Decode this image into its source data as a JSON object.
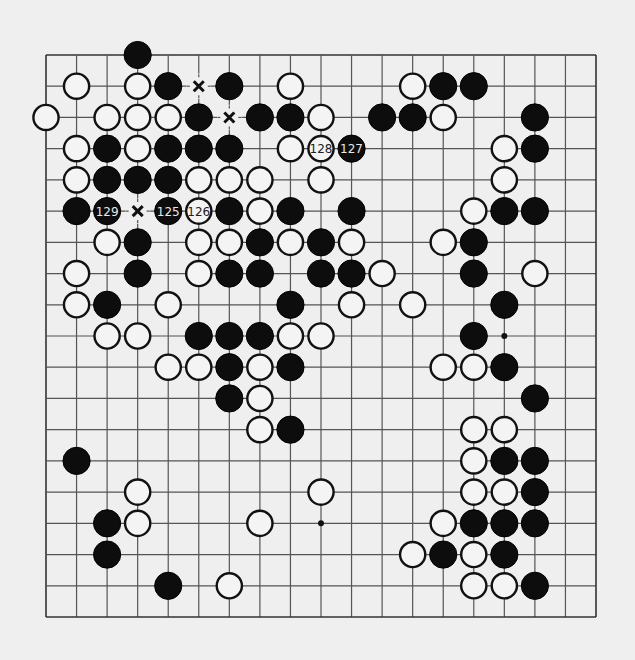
{
  "board": {
    "size": 19,
    "colors": {
      "background": "#efefef",
      "line": "#555555",
      "black_stone": "#0d0d0d",
      "white_stone": "#f4f4f4"
    },
    "stones": [
      {
        "row": 0,
        "col": 3,
        "color": "black"
      },
      {
        "row": 1,
        "col": 1,
        "color": "white"
      },
      {
        "row": 1,
        "col": 3,
        "color": "white"
      },
      {
        "row": 1,
        "col": 4,
        "color": "black"
      },
      {
        "row": 1,
        "col": 6,
        "color": "black"
      },
      {
        "row": 1,
        "col": 8,
        "color": "white"
      },
      {
        "row": 1,
        "col": 12,
        "color": "white"
      },
      {
        "row": 1,
        "col": 13,
        "color": "black"
      },
      {
        "row": 1,
        "col": 14,
        "color": "black"
      },
      {
        "row": 2,
        "col": 0,
        "color": "white"
      },
      {
        "row": 2,
        "col": 2,
        "color": "white"
      },
      {
        "row": 2,
        "col": 3,
        "color": "white"
      },
      {
        "row": 2,
        "col": 4,
        "color": "white"
      },
      {
        "row": 2,
        "col": 5,
        "color": "black"
      },
      {
        "row": 2,
        "col": 7,
        "color": "black"
      },
      {
        "row": 2,
        "col": 8,
        "color": "black"
      },
      {
        "row": 2,
        "col": 9,
        "color": "white"
      },
      {
        "row": 2,
        "col": 11,
        "color": "black"
      },
      {
        "row": 2,
        "col": 12,
        "color": "black"
      },
      {
        "row": 2,
        "col": 13,
        "color": "white"
      },
      {
        "row": 2,
        "col": 16,
        "color": "black"
      },
      {
        "row": 3,
        "col": 1,
        "color": "white"
      },
      {
        "row": 3,
        "col": 2,
        "color": "black"
      },
      {
        "row": 3,
        "col": 3,
        "color": "white"
      },
      {
        "row": 3,
        "col": 4,
        "color": "black"
      },
      {
        "row": 3,
        "col": 5,
        "color": "black"
      },
      {
        "row": 3,
        "col": 6,
        "color": "black"
      },
      {
        "row": 3,
        "col": 8,
        "color": "white"
      },
      {
        "row": 3,
        "col": 9,
        "color": "white",
        "label": "128"
      },
      {
        "row": 3,
        "col": 10,
        "color": "black",
        "label": "127"
      },
      {
        "row": 3,
        "col": 15,
        "color": "white"
      },
      {
        "row": 3,
        "col": 16,
        "color": "black"
      },
      {
        "row": 4,
        "col": 1,
        "color": "white"
      },
      {
        "row": 4,
        "col": 2,
        "color": "black"
      },
      {
        "row": 4,
        "col": 3,
        "color": "black"
      },
      {
        "row": 4,
        "col": 4,
        "color": "black"
      },
      {
        "row": 4,
        "col": 5,
        "color": "white"
      },
      {
        "row": 4,
        "col": 6,
        "color": "white"
      },
      {
        "row": 4,
        "col": 7,
        "color": "white"
      },
      {
        "row": 4,
        "col": 9,
        "color": "white"
      },
      {
        "row": 4,
        "col": 15,
        "color": "white"
      },
      {
        "row": 5,
        "col": 1,
        "color": "black"
      },
      {
        "row": 5,
        "col": 2,
        "color": "black",
        "label": "129"
      },
      {
        "row": 5,
        "col": 4,
        "color": "black",
        "label": "125"
      },
      {
        "row": 5,
        "col": 5,
        "color": "white",
        "label": "126"
      },
      {
        "row": 5,
        "col": 6,
        "color": "black"
      },
      {
        "row": 5,
        "col": 7,
        "color": "white"
      },
      {
        "row": 5,
        "col": 8,
        "color": "black"
      },
      {
        "row": 5,
        "col": 10,
        "color": "black"
      },
      {
        "row": 5,
        "col": 14,
        "color": "white"
      },
      {
        "row": 5,
        "col": 15,
        "color": "black"
      },
      {
        "row": 5,
        "col": 16,
        "color": "black"
      },
      {
        "row": 6,
        "col": 2,
        "color": "white"
      },
      {
        "row": 6,
        "col": 3,
        "color": "black"
      },
      {
        "row": 6,
        "col": 5,
        "color": "white"
      },
      {
        "row": 6,
        "col": 6,
        "color": "white"
      },
      {
        "row": 6,
        "col": 7,
        "color": "black"
      },
      {
        "row": 6,
        "col": 8,
        "color": "white"
      },
      {
        "row": 6,
        "col": 9,
        "color": "black"
      },
      {
        "row": 6,
        "col": 10,
        "color": "white"
      },
      {
        "row": 6,
        "col": 13,
        "color": "white"
      },
      {
        "row": 6,
        "col": 14,
        "color": "black"
      },
      {
        "row": 7,
        "col": 1,
        "color": "white"
      },
      {
        "row": 7,
        "col": 3,
        "color": "black"
      },
      {
        "row": 7,
        "col": 5,
        "color": "white"
      },
      {
        "row": 7,
        "col": 6,
        "color": "black"
      },
      {
        "row": 7,
        "col": 7,
        "color": "black"
      },
      {
        "row": 7,
        "col": 9,
        "color": "black"
      },
      {
        "row": 7,
        "col": 10,
        "color": "black"
      },
      {
        "row": 7,
        "col": 11,
        "color": "white"
      },
      {
        "row": 7,
        "col": 14,
        "color": "black"
      },
      {
        "row": 7,
        "col": 16,
        "color": "white"
      },
      {
        "row": 8,
        "col": 1,
        "color": "white"
      },
      {
        "row": 8,
        "col": 2,
        "color": "black"
      },
      {
        "row": 8,
        "col": 4,
        "color": "white"
      },
      {
        "row": 8,
        "col": 8,
        "color": "black"
      },
      {
        "row": 8,
        "col": 10,
        "color": "white"
      },
      {
        "row": 8,
        "col": 12,
        "color": "white"
      },
      {
        "row": 8,
        "col": 15,
        "color": "black"
      },
      {
        "row": 9,
        "col": 2,
        "color": "white"
      },
      {
        "row": 9,
        "col": 3,
        "color": "white"
      },
      {
        "row": 9,
        "col": 5,
        "color": "black"
      },
      {
        "row": 9,
        "col": 6,
        "color": "black"
      },
      {
        "row": 9,
        "col": 7,
        "color": "black"
      },
      {
        "row": 9,
        "col": 8,
        "color": "white"
      },
      {
        "row": 9,
        "col": 9,
        "color": "white"
      },
      {
        "row": 9,
        "col": 14,
        "color": "black"
      },
      {
        "row": 10,
        "col": 4,
        "color": "white"
      },
      {
        "row": 10,
        "col": 5,
        "color": "white"
      },
      {
        "row": 10,
        "col": 6,
        "color": "black"
      },
      {
        "row": 10,
        "col": 7,
        "color": "white"
      },
      {
        "row": 10,
        "col": 8,
        "color": "black"
      },
      {
        "row": 10,
        "col": 13,
        "color": "white"
      },
      {
        "row": 10,
        "col": 14,
        "color": "white"
      },
      {
        "row": 10,
        "col": 15,
        "color": "black"
      },
      {
        "row": 11,
        "col": 6,
        "color": "black"
      },
      {
        "row": 11,
        "col": 7,
        "color": "white"
      },
      {
        "row": 11,
        "col": 16,
        "color": "black"
      },
      {
        "row": 12,
        "col": 7,
        "color": "white"
      },
      {
        "row": 12,
        "col": 8,
        "color": "black"
      },
      {
        "row": 12,
        "col": 14,
        "color": "white"
      },
      {
        "row": 12,
        "col": 15,
        "color": "white"
      },
      {
        "row": 13,
        "col": 1,
        "color": "black"
      },
      {
        "row": 13,
        "col": 14,
        "color": "white"
      },
      {
        "row": 13,
        "col": 15,
        "color": "black"
      },
      {
        "row": 13,
        "col": 16,
        "color": "black"
      },
      {
        "row": 14,
        "col": 3,
        "color": "white"
      },
      {
        "row": 14,
        "col": 9,
        "color": "white"
      },
      {
        "row": 14,
        "col": 14,
        "color": "white"
      },
      {
        "row": 14,
        "col": 15,
        "color": "white"
      },
      {
        "row": 14,
        "col": 16,
        "color": "black"
      },
      {
        "row": 15,
        "col": 2,
        "color": "black"
      },
      {
        "row": 15,
        "col": 3,
        "color": "white"
      },
      {
        "row": 15,
        "col": 7,
        "color": "white"
      },
      {
        "row": 15,
        "col": 13,
        "color": "white"
      },
      {
        "row": 15,
        "col": 14,
        "color": "black"
      },
      {
        "row": 15,
        "col": 15,
        "color": "black"
      },
      {
        "row": 15,
        "col": 16,
        "color": "black"
      },
      {
        "row": 16,
        "col": 2,
        "color": "black"
      },
      {
        "row": 16,
        "col": 12,
        "color": "white"
      },
      {
        "row": 16,
        "col": 13,
        "color": "black"
      },
      {
        "row": 16,
        "col": 14,
        "color": "white"
      },
      {
        "row": 16,
        "col": 15,
        "color": "black"
      },
      {
        "row": 17,
        "col": 4,
        "color": "black"
      },
      {
        "row": 17,
        "col": 6,
        "color": "white"
      },
      {
        "row": 17,
        "col": 14,
        "color": "white"
      },
      {
        "row": 17,
        "col": 15,
        "color": "white"
      },
      {
        "row": 17,
        "col": 16,
        "color": "black"
      }
    ],
    "x_marks": [
      {
        "row": 1,
        "col": 5
      },
      {
        "row": 2,
        "col": 6
      },
      {
        "row": 5,
        "col": 3
      }
    ],
    "visible_hoshi": [
      {
        "row": 9,
        "col": 15
      },
      {
        "row": 15,
        "col": 9
      }
    ]
  }
}
